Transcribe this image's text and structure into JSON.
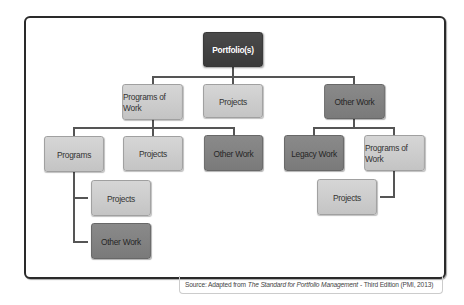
{
  "diagram": {
    "type": "hierarchy",
    "root": {
      "label": "Portfolio(s)",
      "shade": "dark",
      "children": [
        {
          "label": "Programs of Work",
          "shade": "light",
          "children": [
            {
              "label": "Programs",
              "shade": "light",
              "children": [
                {
                  "label": "Projects",
                  "shade": "light"
                },
                {
                  "label": "Other Work",
                  "shade": "mid"
                }
              ]
            },
            {
              "label": "Projects",
              "shade": "light"
            },
            {
              "label": "Other Work",
              "shade": "mid"
            }
          ]
        },
        {
          "label": "Projects",
          "shade": "light"
        },
        {
          "label": "Other Work",
          "shade": "mid",
          "children": [
            {
              "label": "Legacy Work",
              "shade": "mid"
            },
            {
              "label": "Programs of Work",
              "shade": "light",
              "children": [
                {
                  "label": "Projects",
                  "shade": "light"
                }
              ]
            }
          ]
        }
      ]
    }
  },
  "nodes": {
    "portfolio": "Portfolio(s)",
    "programs_of_work_left": "Programs of Work",
    "projects_top": "Projects",
    "other_work_top": "Other Work",
    "programs": "Programs",
    "projects_mid_left": "Projects",
    "other_work_mid": "Other Work",
    "legacy_work": "Legacy Work",
    "programs_of_work_right": "Programs of Work",
    "projects_under_programs": "Projects",
    "other_work_under_programs": "Other Work",
    "projects_under_programs_of_work_right": "Projects"
  },
  "caption": {
    "prefix": "Source: Adapted from",
    "title": "The Standard for Portfolio Management",
    "suffix": "- Third Edition (PMI, 2013)"
  },
  "colors": {
    "dark": "#414141",
    "mid": "#828282",
    "light": "#cdcdcd",
    "connector": "#555555",
    "frame": "#2a2a2a"
  }
}
